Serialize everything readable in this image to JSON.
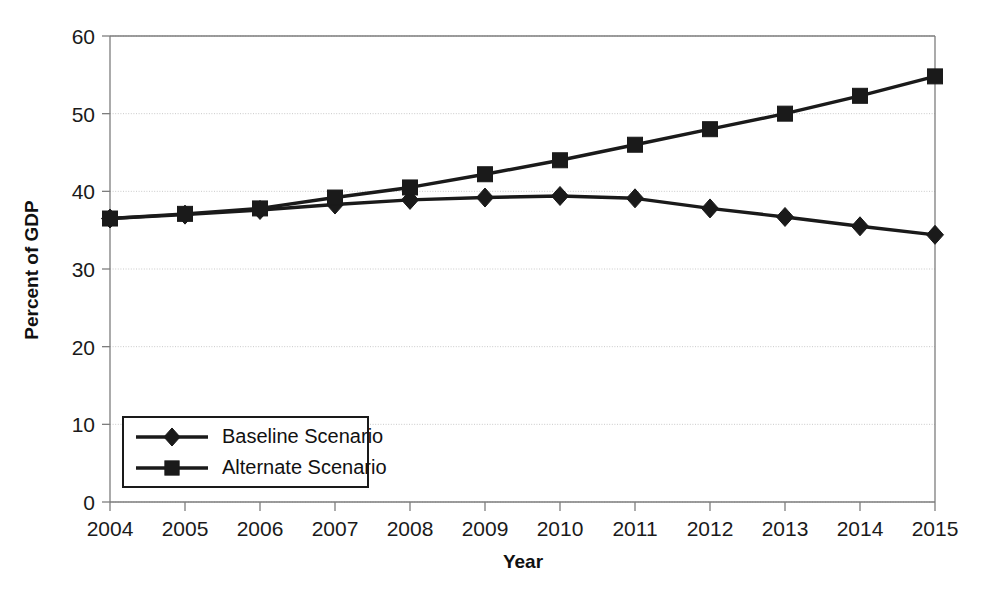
{
  "chart_data": {
    "type": "line",
    "title": "",
    "subtitle": "",
    "xlabel": "Year",
    "ylabel": "Percent of GDP",
    "x": [
      2004,
      2005,
      2006,
      2007,
      2008,
      2009,
      2010,
      2011,
      2012,
      2013,
      2014,
      2015
    ],
    "categories": [
      "2004",
      "2005",
      "2006",
      "2007",
      "2008",
      "2009",
      "2010",
      "2011",
      "2012",
      "2013",
      "2014",
      "2015"
    ],
    "xlim": [
      2004,
      2015
    ],
    "ylim": [
      0,
      60
    ],
    "yticks": [
      0,
      10,
      20,
      30,
      40,
      50,
      60
    ],
    "ytick_labels": [
      "0",
      "10",
      "20",
      "30",
      "40",
      "50",
      "60"
    ],
    "xticks": [
      2004,
      2005,
      2006,
      2007,
      2008,
      2009,
      2010,
      2011,
      2012,
      2013,
      2014,
      2015
    ],
    "grid": true,
    "grid_axis": "y",
    "legend_position": "lower-left-inside",
    "series": [
      {
        "name": "Baseline Scenario",
        "marker": "diamond",
        "color": "#1a1a1a",
        "values": [
          36.5,
          37.0,
          37.6,
          38.3,
          38.9,
          39.2,
          39.4,
          39.1,
          37.8,
          36.7,
          35.5,
          34.4
        ]
      },
      {
        "name": "Alternate Scenario",
        "marker": "square",
        "color": "#1a1a1a",
        "values": [
          36.5,
          37.1,
          37.8,
          39.2,
          40.5,
          42.2,
          44.0,
          46.0,
          48.0,
          50.0,
          52.3,
          54.8
        ]
      }
    ]
  },
  "axes": {
    "x_title": "Year",
    "y_title": "Percent of GDP"
  },
  "legend": {
    "entries": [
      {
        "label": "Baseline Scenario",
        "marker": "diamond-marker-icon"
      },
      {
        "label": "Alternate Scenario",
        "marker": "square-marker-icon"
      }
    ]
  },
  "colors": {
    "line": "#1a1a1a",
    "grid": "#c9c9c9",
    "axis": "#7d7d7d",
    "background": "#ffffff",
    "text": "#111111"
  }
}
